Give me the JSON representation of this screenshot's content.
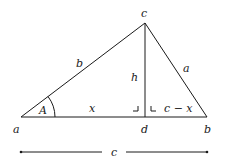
{
  "diagram": {
    "type": "triangle-altitude",
    "vertices": {
      "a": {
        "label": "a",
        "x": 21,
        "y": 117
      },
      "b": {
        "label": "b",
        "x": 207,
        "y": 117
      },
      "c": {
        "label": "c",
        "x": 145,
        "y": 23
      },
      "d": {
        "label": "d",
        "x": 145,
        "y": 117
      }
    },
    "side_labels": {
      "b": "b",
      "a": "a",
      "h": "h",
      "x": "x",
      "c_minus_x": "c − x"
    },
    "angle_label": "A",
    "base_dimension_label": "c",
    "right_angle_markers": 2,
    "stroke_color": "#1a1a1a",
    "background": "#ffffff"
  }
}
